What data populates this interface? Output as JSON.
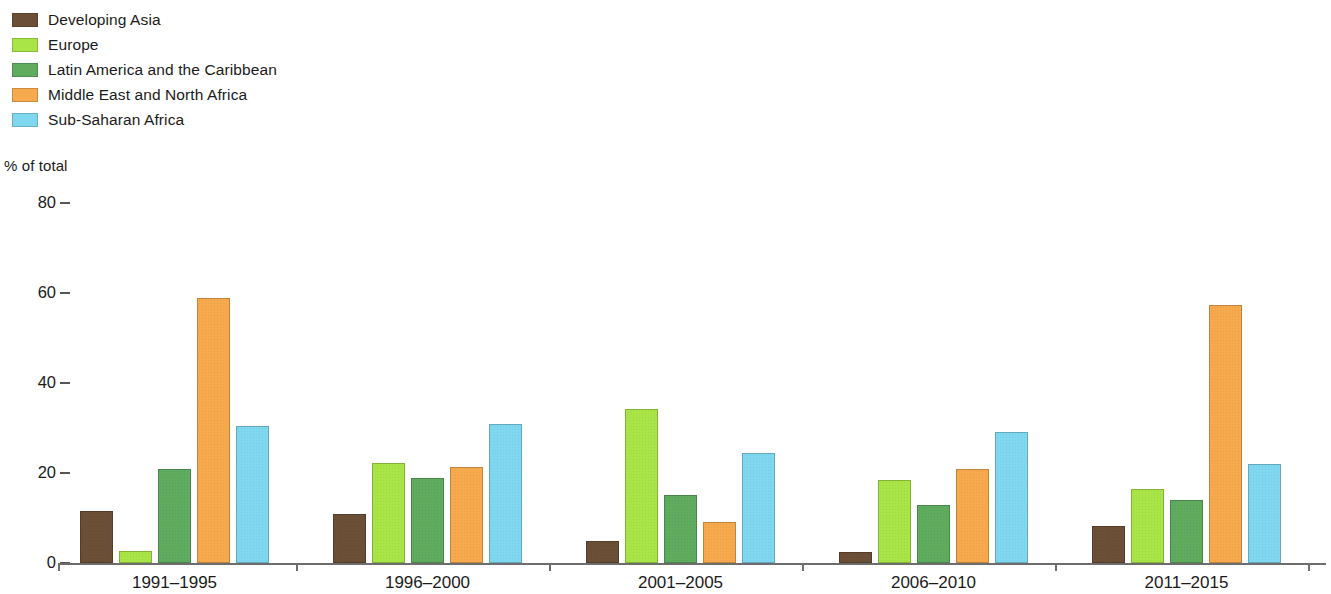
{
  "chart_data": {
    "type": "bar",
    "title": "",
    "subtitle": "",
    "xlabel": "",
    "ylabel": "% of total",
    "ylim": [
      0,
      80
    ],
    "yticks": [
      0,
      20,
      40,
      60,
      80
    ],
    "grid": false,
    "legend_position": "top-left",
    "categories": [
      "1991–1995",
      "1996–2000",
      "2001–2005",
      "2006–2010",
      "2011–2015"
    ],
    "series": [
      {
        "name": "Developing Asia",
        "color": "#6b4f36",
        "values": [
          11.5,
          10.8,
          5.0,
          2.5,
          8.2
        ]
      },
      {
        "name": "Europe",
        "color": "#a9e547",
        "values": [
          2.7,
          22.2,
          34.3,
          18.5,
          16.5
        ]
      },
      {
        "name": "Latin America and the Caribbean",
        "color": "#5fac5f",
        "values": [
          21.0,
          19.0,
          15.2,
          12.8,
          14.0
        ]
      },
      {
        "name": "Middle East and North Africa",
        "color": "#f7aa4d",
        "values": [
          59.0,
          21.4,
          9.2,
          21.0,
          57.3
        ]
      },
      {
        "name": "Sub-Saharan Africa",
        "color": "#7fd8f0",
        "values": [
          30.5,
          31.0,
          24.5,
          29.2,
          22.0
        ]
      }
    ]
  },
  "axis": {
    "unit_caption": "% of total",
    "tick_labels": [
      "80",
      "60",
      "40",
      "20",
      "0"
    ]
  },
  "legend": {
    "items": [
      {
        "label": "Developing Asia",
        "color": "#6b4f36"
      },
      {
        "label": "Europe",
        "color": "#a9e547"
      },
      {
        "label": "Latin America and the Caribbean",
        "color": "#5fac5f"
      },
      {
        "label": "Middle East and North Africa",
        "color": "#f7aa4d"
      },
      {
        "label": "Sub-Saharan Africa",
        "color": "#7fd8f0"
      }
    ]
  }
}
